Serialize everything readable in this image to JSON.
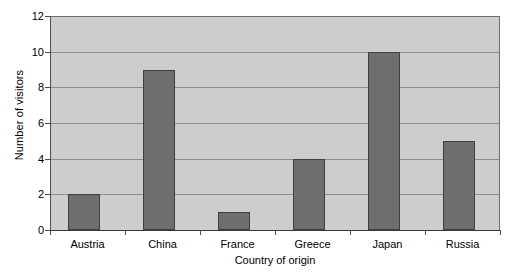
{
  "chart_data": {
    "type": "bar",
    "title": "",
    "subtitle": "",
    "xlabel": "Country of origin",
    "ylabel": "Number of visitors",
    "categories": [
      "Austria",
      "China",
      "France",
      "Greece",
      "Japan",
      "Russia"
    ],
    "values": [
      2,
      9,
      1,
      4,
      10,
      5
    ],
    "series": [
      {
        "name": "Number of visitors",
        "values": [
          2,
          9,
          1,
          4,
          10,
          5
        ]
      }
    ],
    "ylim": [
      0,
      12
    ],
    "ytick_step": 2,
    "ytick_labels": [
      "0",
      "2",
      "4",
      "6",
      "8",
      "10",
      "12"
    ],
    "ytick_values": [
      0,
      2,
      4,
      6,
      8,
      10,
      12
    ],
    "grid": true,
    "grid_axis": "y",
    "legend": false,
    "legend_position": "none",
    "bar_color": "#6e6e6e",
    "bar_edge_color": "#3f3f3f",
    "plot_background": "#cdcdcd",
    "gridline_color": "#8d8d8d",
    "axis_color": "#3a3a3a",
    "figure_background": "#ffffff"
  }
}
